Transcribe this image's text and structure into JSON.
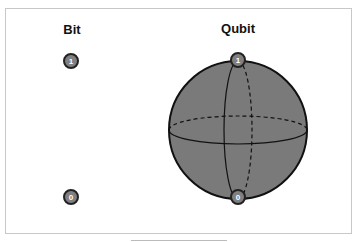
{
  "diagram": {
    "bit": {
      "title": "Bit",
      "states": [
        "1",
        "0"
      ]
    },
    "qubit": {
      "title": "Qubit",
      "north_label": "1",
      "south_label": "0"
    },
    "colors": {
      "sphere_fill": "#7a7a7a",
      "state_fill": "#808080",
      "stroke": "#111111",
      "frame": "#c8c8c8"
    }
  }
}
